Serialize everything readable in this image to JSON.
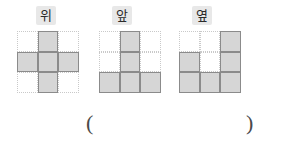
{
  "figures": [
    {
      "label": "위",
      "label_meaning": "top-view",
      "grid": {
        "rows": 3,
        "cols": 3,
        "filled": [
          [
            false,
            true,
            false
          ],
          [
            true,
            true,
            true
          ],
          [
            false,
            true,
            false
          ]
        ],
        "filled_count": 5,
        "shape": "plus"
      },
      "position": {
        "left": 17,
        "label_left": 36,
        "label_width": 24
      }
    },
    {
      "label": "앞",
      "label_meaning": "front-view",
      "grid": {
        "rows": 3,
        "cols": 3,
        "filled": [
          [
            false,
            true,
            false
          ],
          [
            false,
            true,
            false
          ],
          [
            true,
            true,
            true
          ]
        ],
        "filled_count": 5,
        "shape": "T"
      },
      "position": {
        "left": 99,
        "label_left": 112,
        "label_width": 24
      }
    },
    {
      "label": "옆",
      "label_meaning": "side-view",
      "grid": {
        "rows": 3,
        "cols": 3,
        "filled": [
          [
            false,
            false,
            true
          ],
          [
            true,
            false,
            true
          ],
          [
            true,
            true,
            true
          ]
        ],
        "filled_count": 6,
        "shape": "U-right"
      },
      "position": {
        "left": 179,
        "label_left": 192,
        "label_width": 24
      }
    }
  ],
  "answer": {
    "open_paren": "(",
    "close_paren": ")",
    "value": ""
  },
  "colors": {
    "cell_fill": "#d6d6d6",
    "cell_border": "#8b8b8b",
    "grid_guide": "#c9c9c9",
    "label_background": "#e8e8e8",
    "label_text": "#2a2a2a",
    "paren_color": "#4a4a4a",
    "page_background": "#ffffff"
  }
}
